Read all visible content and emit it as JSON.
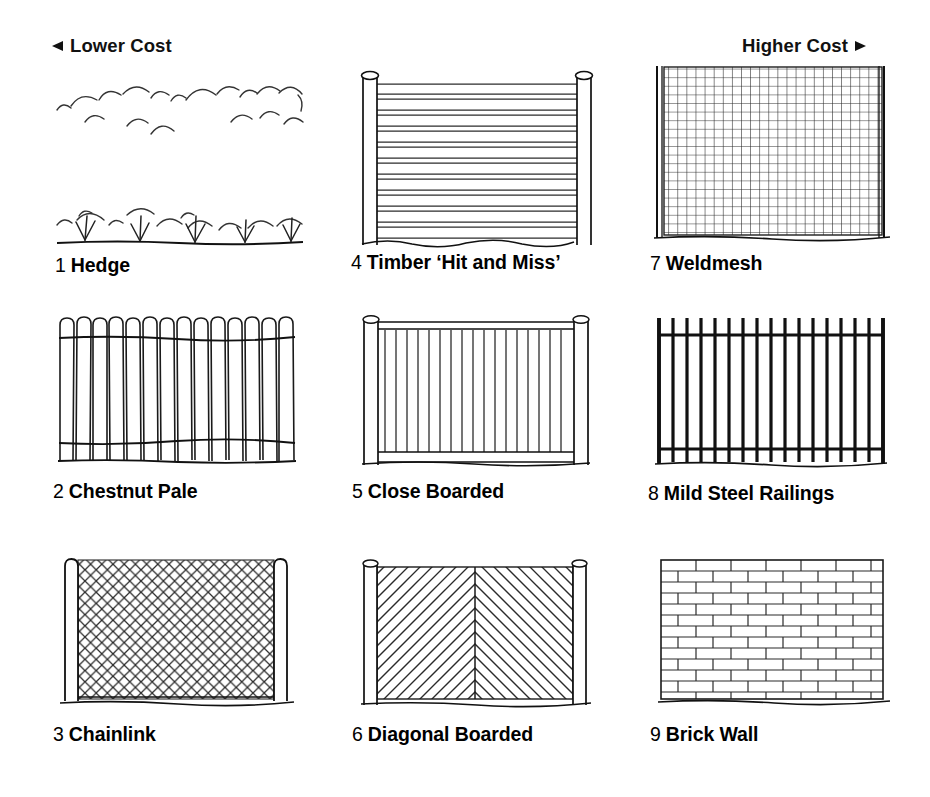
{
  "scale": {
    "lower": {
      "label": "Lower Cost",
      "icon": "arrow-left-icon"
    },
    "higher": {
      "label": "Higher Cost",
      "icon": "arrow-right-icon"
    }
  },
  "colors": {
    "ink": "#000000",
    "line": "#1a1a1a",
    "background": "#ffffff"
  },
  "items": [
    {
      "number": "1",
      "name": "Hedge",
      "illustration": "hedge",
      "column": 1,
      "row": 1
    },
    {
      "number": "2",
      "name": "Chestnut Pale",
      "illustration": "chestnut-pale",
      "column": 1,
      "row": 2
    },
    {
      "number": "3",
      "name": "Chainlink",
      "illustration": "chainlink",
      "column": 1,
      "row": 3
    },
    {
      "number": "4",
      "name": "Timber ‘Hit and Miss’",
      "illustration": "timber-hit-and-miss",
      "column": 2,
      "row": 1
    },
    {
      "number": "5",
      "name": "Close Boarded",
      "illustration": "close-boarded",
      "column": 2,
      "row": 2
    },
    {
      "number": "6",
      "name": "Diagonal Boarded",
      "illustration": "diagonal-boarded",
      "column": 2,
      "row": 3
    },
    {
      "number": "7",
      "name": "Weldmesh",
      "illustration": "weldmesh",
      "column": 3,
      "row": 1
    },
    {
      "number": "8",
      "name": "Mild Steel Railings",
      "illustration": "mild-steel-railings",
      "column": 3,
      "row": 2
    },
    {
      "number": "9",
      "name": "Brick Wall",
      "illustration": "brick-wall",
      "column": 3,
      "row": 3
    }
  ]
}
